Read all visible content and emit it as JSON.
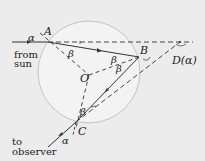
{
  "diagram": {
    "points": {
      "A": {
        "label": "A"
      },
      "B": {
        "label": "B"
      },
      "O": {
        "label": "O"
      },
      "C": {
        "label": "C"
      },
      "D": {
        "label": "D(α)"
      }
    },
    "angles": {
      "incidence": "α",
      "exit": "α",
      "refraction_A": "β",
      "reflection_B1": "β",
      "reflection_B2": "β",
      "refraction_C": "β"
    },
    "text": {
      "from_line1": "from",
      "from_line2": "sun",
      "to_line1": "to",
      "to_line2": "observer"
    },
    "colors": {
      "background": "#ececec",
      "drop_fill": "#f3f3f3",
      "drop_stroke": "#b8b8b8",
      "line": "#333333"
    }
  }
}
